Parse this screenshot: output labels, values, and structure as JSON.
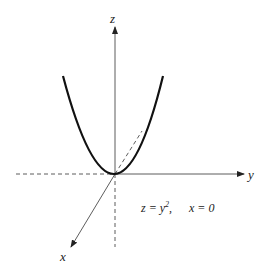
{
  "axes": {
    "z_label": "z",
    "y_label": "y",
    "x_label": "x"
  },
  "equation": {
    "lhs": "z = y",
    "exponent": "2",
    "sep": ",",
    "condition": "x = 0"
  },
  "colors": {
    "curve": "#111111",
    "axis": "#333333",
    "background": "#ffffff"
  }
}
